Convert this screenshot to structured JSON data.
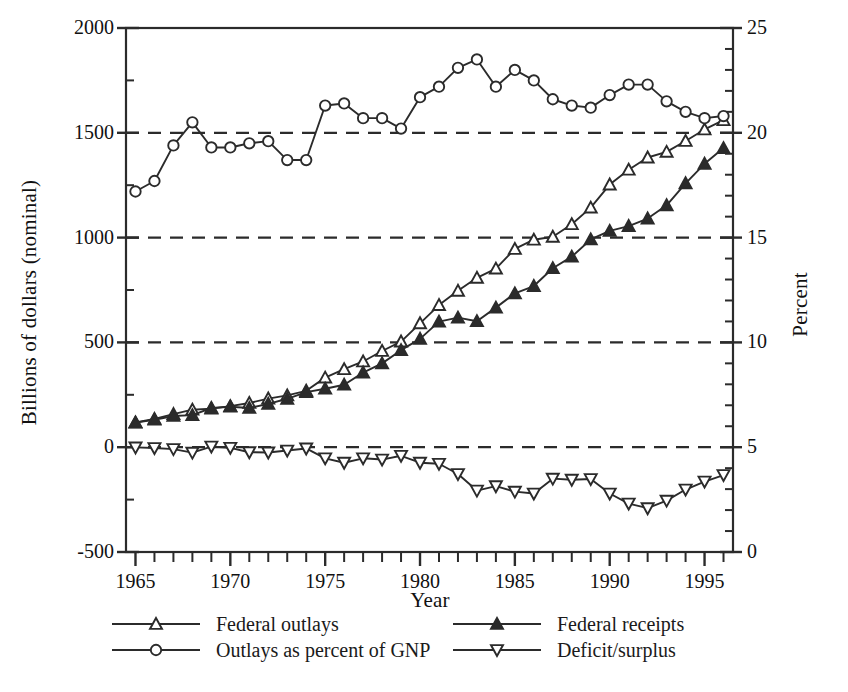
{
  "chart_data": {
    "type": "line",
    "title": "",
    "xlabel": "Year",
    "ylabel": "Billions of dollars (nominal)",
    "ylabel_right": "Percent",
    "xlim": [
      1964.5,
      1996.5
    ],
    "ylim": [
      -500,
      2000
    ],
    "ylim_right": [
      0,
      25
    ],
    "y_ticks": [
      -500,
      0,
      500,
      1000,
      1500,
      2000
    ],
    "y_minor_step": 250,
    "y_ticks_right": [
      0,
      5,
      10,
      15,
      20,
      25
    ],
    "y_minor_step_right": 1,
    "x_ticks": [
      1965,
      1970,
      1975,
      1980,
      1985,
      1990,
      1995
    ],
    "x_minor_step": 1,
    "grid": "horizontal-dashed",
    "gridlines": [
      0,
      500,
      1000,
      1500
    ],
    "legend_position": "below-plot-two-columns",
    "x": [
      1965,
      1966,
      1967,
      1968,
      1969,
      1970,
      1971,
      1972,
      1973,
      1974,
      1975,
      1976,
      1977,
      1978,
      1979,
      1980,
      1981,
      1982,
      1983,
      1984,
      1985,
      1986,
      1987,
      1988,
      1989,
      1990,
      1991,
      1992,
      1993,
      1994,
      1995,
      1996
    ],
    "series": [
      {
        "name": "Federal outlays",
        "axis": "left",
        "marker": "triangle-up-open",
        "values": [
          118,
          135,
          158,
          179,
          184,
          196,
          211,
          232,
          247,
          269,
          332,
          372,
          409,
          459,
          504,
          591,
          678,
          746,
          808,
          852,
          946,
          990,
          1004,
          1064,
          1143,
          1253,
          1324,
          1382,
          1409,
          1461,
          1516,
          1560
        ]
      },
      {
        "name": "Federal receipts",
        "axis": "left",
        "marker": "triangle-up-filled",
        "values": [
          117,
          131,
          149,
          153,
          187,
          193,
          187,
          207,
          231,
          263,
          279,
          298,
          356,
          400,
          463,
          517,
          599,
          618,
          601,
          666,
          734,
          769,
          854,
          909,
          991,
          1032,
          1055,
          1091,
          1154,
          1259,
          1352,
          1427
        ]
      },
      {
        "name": "Deficit/surplus",
        "axis": "left",
        "marker": "triangle-down-open",
        "values": [
          -1,
          -4,
          -9,
          -26,
          3,
          -3,
          -24,
          -25,
          -16,
          -6,
          -53,
          -74,
          -53,
          -59,
          -41,
          -74,
          -79,
          -128,
          -207,
          -186,
          -212,
          -221,
          -150,
          -155,
          -152,
          -221,
          -269,
          -291,
          -255,
          -202,
          -164,
          -133
        ]
      },
      {
        "name": "Outlays as percent of GNP",
        "axis": "right",
        "marker": "circle-open",
        "values": [
          17.2,
          17.7,
          19.4,
          20.5,
          19.3,
          19.3,
          19.5,
          19.6,
          18.7,
          18.7,
          21.3,
          21.4,
          20.7,
          20.7,
          20.2,
          21.7,
          22.2,
          23.1,
          23.5,
          22.2,
          23.0,
          22.5,
          21.6,
          21.3,
          21.2,
          21.8,
          22.3,
          22.3,
          21.5,
          21.0,
          20.7,
          20.8
        ]
      }
    ]
  },
  "axes": {
    "left_tick_labels": [
      "2000",
      "1500",
      "1000",
      "500",
      "0",
      "-500"
    ],
    "right_tick_labels": [
      "25",
      "20",
      "15",
      "10",
      "5",
      "0"
    ],
    "x_tick_labels": [
      "1965",
      "1970",
      "1975",
      "1980",
      "1985",
      "1990",
      "1995"
    ],
    "x_title": "Year",
    "y_title_left": "Billions of dollars (nominal)",
    "y_title_right": "Percent"
  },
  "legend": {
    "items": [
      {
        "label": "Federal outlays",
        "marker": "triangle-up-open"
      },
      {
        "label": "Federal receipts",
        "marker": "triangle-up-filled"
      },
      {
        "label": "Outlays as percent of GNP",
        "marker": "circle-open"
      },
      {
        "label": "Deficit/surplus",
        "marker": "triangle-down-open"
      }
    ]
  },
  "colors": {
    "ink": "#1a1a1a",
    "line": "#2b2b2b",
    "grid": "#2b2b2b",
    "background": "#ffffff"
  }
}
